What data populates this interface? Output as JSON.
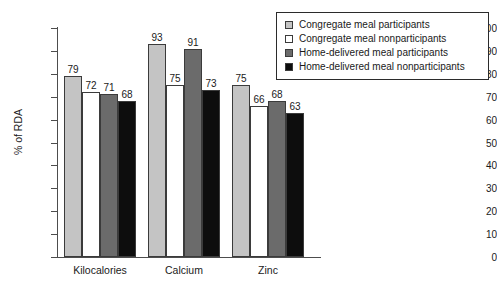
{
  "chart_data": {
    "type": "bar",
    "title": "",
    "xlabel": "",
    "ylabel": "% of RDA",
    "ylim": [
      0,
      100
    ],
    "yticks": [
      0,
      10,
      20,
      30,
      40,
      50,
      60,
      70,
      80,
      90,
      100
    ],
    "grid": false,
    "legend_position": "top-right",
    "categories": [
      "Kilocalories",
      "Calcium",
      "Zinc"
    ],
    "series": [
      {
        "name": "Congregate meal participants",
        "color": "#c4c4c4",
        "values": [
          79,
          93,
          75
        ]
      },
      {
        "name": "Congregate meal nonparticipants",
        "color": "#ffffff",
        "values": [
          72,
          75,
          66
        ]
      },
      {
        "name": "Home-delivered meal participants",
        "color": "#6b6b6b",
        "values": [
          71,
          91,
          68
        ]
      },
      {
        "name": "Home-delivered meal nonparticipants",
        "color": "#0d0d0d",
        "values": [
          68,
          73,
          63
        ]
      }
    ]
  }
}
